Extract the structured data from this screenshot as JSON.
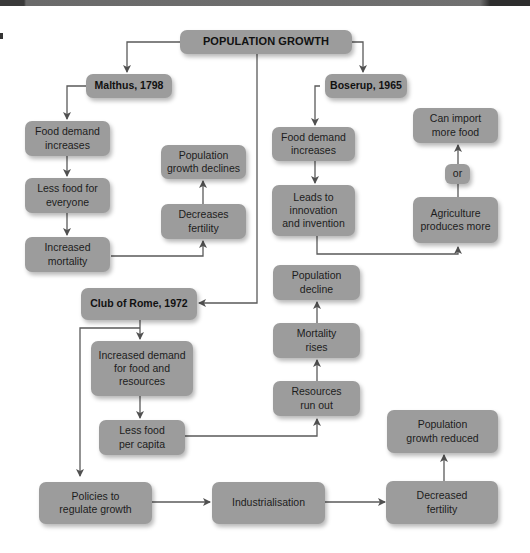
{
  "diagram": {
    "type": "flowchart",
    "title": "POPULATION GROWTH",
    "colors": {
      "box_fill": "#9c9c9c",
      "line": "#555555",
      "text": "#1c1c1c",
      "background": "#ffffff"
    },
    "nodes": {
      "root": "POPULATION GROWTH",
      "malthus": "Malthus, 1798",
      "boserup": "Boserup, 1965",
      "club_of_rome": "Club of Rome, 1972",
      "m_food_demand": "Food demand\nincreases",
      "m_less_food": "Less food for\neveryone",
      "m_increased_mortality": "Increased\nmortality",
      "m_decreases_fertility": "Decreases\nfertility",
      "m_pop_growth_declines": "Population\ngrowth declines",
      "b_food_demand": "Food demand\nincreases",
      "b_leads_to": "Leads to\ninnovation\nand invention",
      "b_agriculture": "Agriculture\nproduces more",
      "b_or": "or",
      "b_can_import": "Can import\nmore food",
      "c_increased_demand": "Increased demand\nfor food and\nresources",
      "c_less_food_per_capita": "Less food\nper capita",
      "c_resources_run_out": "Resources\nrun out",
      "c_mortality_rises": "Mortality\nrises",
      "c_population_decline": "Population\ndecline",
      "c_policies": "Policies to\nregulate growth",
      "c_industrialisation": "Industrialisation",
      "c_decreased_fertility": "Decreased\nfertility",
      "c_pop_growth_reduced": "Population\ngrowth reduced"
    },
    "edges": [
      [
        "root",
        "malthus"
      ],
      [
        "root",
        "boserup"
      ],
      [
        "root",
        "club_of_rome"
      ],
      [
        "malthus",
        "m_food_demand"
      ],
      [
        "m_food_demand",
        "m_less_food"
      ],
      [
        "m_less_food",
        "m_increased_mortality"
      ],
      [
        "m_increased_mortality",
        "m_decreases_fertility"
      ],
      [
        "m_decreases_fertility",
        "m_pop_growth_declines"
      ],
      [
        "boserup",
        "b_food_demand"
      ],
      [
        "b_food_demand",
        "b_leads_to"
      ],
      [
        "b_leads_to",
        "b_agriculture"
      ],
      [
        "b_agriculture",
        "b_or"
      ],
      [
        "b_or",
        "b_can_import"
      ],
      [
        "club_of_rome",
        "c_increased_demand"
      ],
      [
        "club_of_rome",
        "c_policies"
      ],
      [
        "c_increased_demand",
        "c_less_food_per_capita"
      ],
      [
        "c_less_food_per_capita",
        "c_resources_run_out"
      ],
      [
        "c_resources_run_out",
        "c_mortality_rises"
      ],
      [
        "c_mortality_rises",
        "c_population_decline"
      ],
      [
        "c_policies",
        "c_industrialisation"
      ],
      [
        "c_industrialisation",
        "c_decreased_fertility"
      ],
      [
        "c_decreased_fertility",
        "c_pop_growth_reduced"
      ]
    ]
  }
}
